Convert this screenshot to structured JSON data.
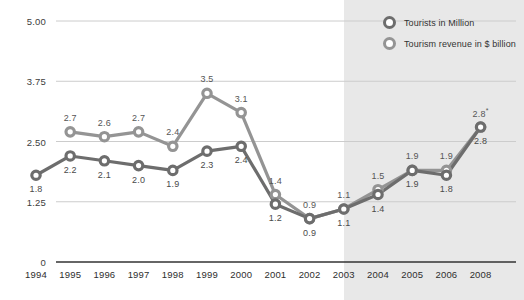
{
  "chart_data": {
    "type": "line",
    "title": "",
    "subtitle": "",
    "xlabel": "",
    "ylabel": "",
    "ylim": [
      0,
      5.0
    ],
    "ytick_labels": [
      "0",
      "1.25",
      "2.50",
      "3.75",
      "5.00"
    ],
    "ytick_values": [
      0,
      1.25,
      2.5,
      3.75,
      5.0
    ],
    "grid": true,
    "legend_position": "top-right",
    "categories": [
      "1994",
      "1995",
      "1996",
      "1997",
      "1998",
      "1999",
      "2000",
      "2001",
      "2002",
      "2003",
      "2004",
      "2005",
      "2006",
      "2008"
    ],
    "series": [
      {
        "name": "Tourists in Million",
        "color": "#6d6d6d",
        "label_position": "below",
        "values": [
          1.8,
          2.2,
          2.1,
          2.0,
          1.9,
          2.3,
          2.4,
          1.2,
          0.9,
          1.1,
          1.4,
          1.9,
          1.8,
          2.8
        ],
        "labels": [
          "1.8",
          "2.2",
          "2.1",
          "2.0",
          "1.9",
          "2.3",
          "2.4",
          "1.2",
          "0.9",
          "1.1",
          "1.4",
          "1.9",
          "1.8",
          "2.8"
        ]
      },
      {
        "name": "Tourism revenue in $ billion",
        "color": "#949494",
        "label_position": "above",
        "values": [
          null,
          2.7,
          2.6,
          2.7,
          2.4,
          3.5,
          3.1,
          1.4,
          0.9,
          1.1,
          1.5,
          1.9,
          1.9,
          2.8
        ],
        "labels": [
          null,
          "2.7",
          "2.6",
          "2.7",
          "2.4",
          "3.5",
          "3.1",
          "1.4",
          "0.9",
          "1.1",
          "1.5",
          "1.9",
          "1.9",
          "2.8"
        ]
      }
    ],
    "annotations": [
      {
        "text": "*",
        "attached_to": "Tourism revenue in $ billion",
        "category": "2008"
      }
    ],
    "shaded_region": {
      "from_category": "2003",
      "to_category": "2008",
      "color": "#e8e8e8",
      "meaning": "projection"
    }
  },
  "legend": {
    "entries": [
      {
        "label": "Tourists in Million",
        "marker": "ring-marker-dark",
        "color": "#6d6d6d"
      },
      {
        "label": "Tourism revenue in $ billion",
        "marker": "ring-marker-light",
        "color": "#949494"
      }
    ]
  },
  "colors": {
    "background": "#ffffff",
    "shade": "#e8e8e8",
    "gridline": "#cccccc",
    "axis": "#333333",
    "series_tourists": "#6d6d6d",
    "series_revenue": "#949494",
    "text": "#333333"
  }
}
